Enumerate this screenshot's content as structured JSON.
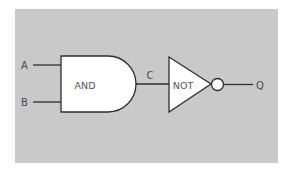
{
  "diagram": {
    "type": "logic-circuit",
    "colors": {
      "background": "#ffffff",
      "panel": "#c9c9c9",
      "gate_fill": "#ffffff",
      "stroke": "#2e2e2e",
      "text": "#4a4a4a"
    },
    "inputs": [
      {
        "label": "A"
      },
      {
        "label": "B"
      }
    ],
    "gates": [
      {
        "type": "and",
        "label": "AND"
      },
      {
        "type": "not",
        "label": "NOT"
      }
    ],
    "intermediate": {
      "label": "C"
    },
    "output": {
      "label": "Q"
    }
  }
}
